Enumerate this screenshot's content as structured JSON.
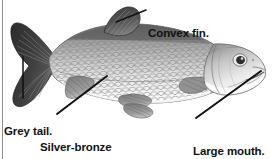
{
  "figure": {
    "kind": "labelled-illustration",
    "background_color": "#ffffff",
    "border": {
      "side": "left",
      "color": "#888888",
      "width_px": 1
    },
    "text_color": "#111111"
  },
  "labels": [
    {
      "id": "convex-fin",
      "text": "Convex fin.",
      "lines": [
        "Convex fin."
      ],
      "points_to": "dorsal-fin",
      "leader_from": [
        146,
        10
      ],
      "leader_to": [
        116,
        22
      ]
    },
    {
      "id": "grey-tail",
      "text": "Grey tail.",
      "lines": [
        "Grey tail."
      ],
      "points_to": "caudal-fin",
      "leader_from": [
        23,
        98
      ],
      "leader_to": [
        23,
        57
      ]
    },
    {
      "id": "silver-bronze-flanks",
      "text": "Silver-bronze flanks.",
      "lines": [
        "Silver-bronze",
        "flanks."
      ],
      "points_to": "flank",
      "leader_from": [
        57,
        114
      ],
      "leader_to": [
        107,
        76
      ]
    },
    {
      "id": "large-mouth",
      "text": "Large mouth.",
      "lines": [
        "Large mouth."
      ],
      "points_to": "mouth",
      "leader_from": [
        196,
        118
      ],
      "leader_to": [
        261,
        71
      ]
    }
  ],
  "illustration": {
    "parts": [
      {
        "name": "caudal-fin",
        "label": "tail",
        "tone": "dark-grey",
        "color": "#3a3a3a"
      },
      {
        "name": "dorsal-fin",
        "label": "convex fin",
        "tone": "dark-grey",
        "color": "#4a4a4a"
      },
      {
        "name": "body",
        "label": "scaled flank",
        "tone": "silver-bronze",
        "color": "#b9b9b9"
      },
      {
        "name": "belly",
        "label": "belly",
        "tone": "white",
        "color": "#f6f6f6"
      },
      {
        "name": "pectoral-fin",
        "label": "pectoral fin",
        "tone": "mid-grey",
        "color": "#8d8d8d"
      },
      {
        "name": "pelvic-fin",
        "label": "pelvic fin",
        "tone": "mid-grey",
        "color": "#8a8a8a"
      },
      {
        "name": "anal-fin",
        "label": "anal fin",
        "tone": "mid-grey",
        "color": "#8a8a8a"
      },
      {
        "name": "head",
        "label": "head",
        "tone": "light-grey",
        "color": "#cfcfcf"
      },
      {
        "name": "eye",
        "label": "eye",
        "tone": "dark",
        "color": "#2a2a2a"
      },
      {
        "name": "mouth",
        "label": "large mouth",
        "tone": "outline",
        "color": "#6a6a6a"
      },
      {
        "name": "gill-cover",
        "label": "gill cover",
        "tone": "light-grey",
        "color": "#c4c4c4"
      }
    ]
  }
}
